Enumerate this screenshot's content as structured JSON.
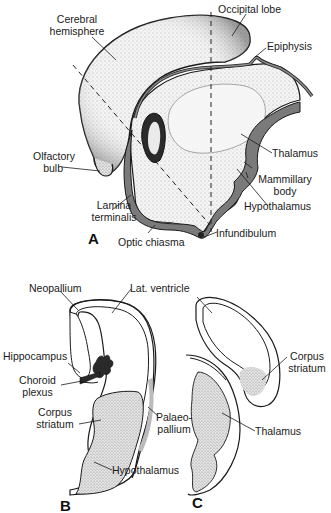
{
  "figure": {
    "panels": [
      {
        "id": "A",
        "letter": "A",
        "view": "sagittal"
      },
      {
        "id": "B",
        "letter": "B",
        "view": "coronal section"
      },
      {
        "id": "C",
        "letter": "C",
        "view": "coronal section"
      }
    ]
  },
  "panel_a": {
    "letter": "A",
    "labels": {
      "cerebral_hemisphere_1": "Cerebral",
      "cerebral_hemisphere_2": "hemisphere",
      "occipital_lobe": "Occipital lobe",
      "epiphysis": "Epiphysis",
      "olfactory_bulb_1": "Olfactory",
      "olfactory_bulb_2": "bulb",
      "thalamus": "Thalamus",
      "mammillary_body_1": "Mammillary",
      "mammillary_body_2": "body",
      "hypothalamus": "Hypothalamus",
      "lamina_terminalis_1": "Lamina",
      "lamina_terminalis_2": "terminalis",
      "optic_chiasma": "Optic chiasma",
      "infundibulum": "Infundibulum"
    }
  },
  "panel_b": {
    "letter": "B",
    "labels": {
      "neopallium": "Neopallium",
      "lat_ventricle": "Lat. ventricle",
      "hippocampus": "Hippocampus",
      "choroid_plexus_1": "Choroid",
      "choroid_plexus_2": "plexus",
      "corpus_striatum_1": "Corpus",
      "corpus_striatum_2": "striatum",
      "palaeopallium_1": "Palaeo-",
      "palaeopallium_2": "pallium",
      "hypothalamus": "Hypothalamus"
    }
  },
  "panel_c": {
    "letter": "C",
    "labels": {
      "corpus_striatum_1": "Corpus",
      "corpus_striatum_2": "striatum",
      "thalamus": "Thalamus"
    }
  },
  "colors": {
    "outline": "#1a1a1a",
    "ventricle_gray": "#7a7a7a",
    "stipple": "#d8d8d8",
    "background": "#ffffff"
  }
}
